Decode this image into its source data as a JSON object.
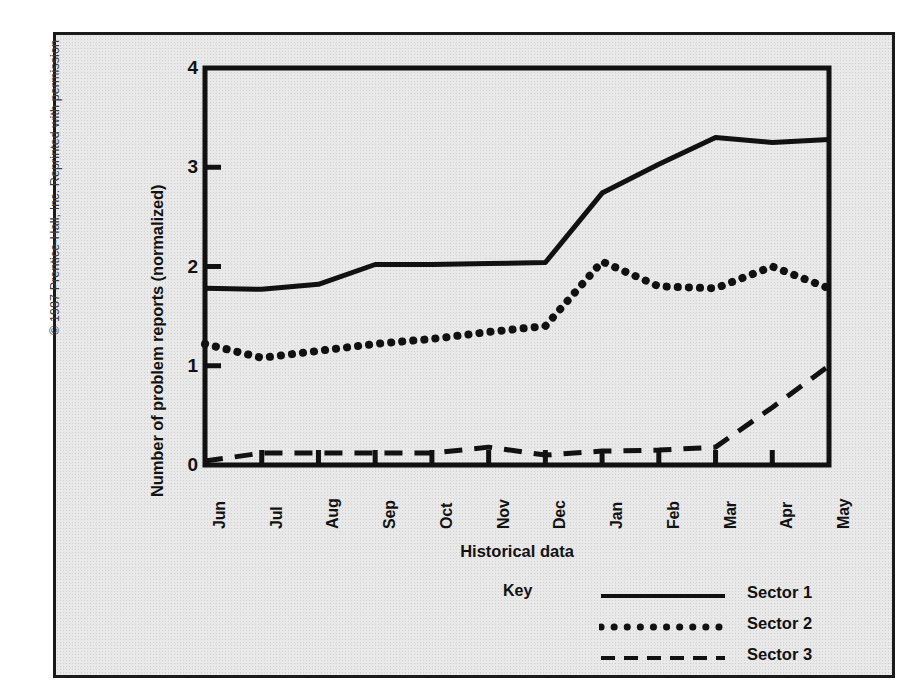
{
  "figure": {
    "copyright": "© 1987 Prentice-Hall, Inc. Reprinted with permission"
  },
  "chart_data": {
    "type": "line",
    "title": "",
    "xlabel": "Historical data",
    "ylabel": "Number of problem reports (normalized)",
    "categories": [
      "Jun",
      "Jul",
      "Aug",
      "Sep",
      "Oct",
      "Nov",
      "Dec",
      "Jan",
      "Feb",
      "Mar",
      "Apr",
      "May"
    ],
    "x_tick_labels": [
      "Jun",
      "Jul",
      "Aug",
      "Sep",
      "Oct",
      "Nov",
      "Dec",
      "Jan",
      "Feb",
      "Mar",
      "Apr",
      "May"
    ],
    "y_tick_labels": [
      "0",
      "1",
      "2",
      "3",
      "4"
    ],
    "y_ticks": [
      0,
      1,
      2,
      3,
      4
    ],
    "ylim": [
      0,
      4
    ],
    "xlim": [
      0,
      11
    ],
    "grid": false,
    "legend_position": "below-plot-center",
    "legend_title": "Key",
    "series": [
      {
        "name": "Sector 1",
        "style": "solid",
        "color": "#111111",
        "values": [
          1.78,
          1.77,
          1.82,
          2.02,
          2.02,
          2.03,
          2.04,
          2.74,
          3.03,
          3.3,
          3.25,
          3.28
        ]
      },
      {
        "name": "Sector 2",
        "style": "dotted",
        "color": "#111111",
        "values": [
          1.22,
          1.08,
          1.15,
          1.22,
          1.27,
          1.34,
          1.4,
          2.05,
          1.8,
          1.78,
          2.0,
          1.78
        ]
      },
      {
        "name": "Sector 3",
        "style": "dashed",
        "color": "#111111",
        "values": [
          0.04,
          0.12,
          0.12,
          0.12,
          0.12,
          0.18,
          0.1,
          0.14,
          0.15,
          0.18,
          0.58,
          1.0
        ]
      }
    ]
  },
  "legend": {
    "title": "Key",
    "entries": [
      {
        "label": "Sector 1",
        "style": "solid"
      },
      {
        "label": "Sector 2",
        "style": "dotted"
      },
      {
        "label": "Sector 3",
        "style": "dashed"
      }
    ]
  }
}
